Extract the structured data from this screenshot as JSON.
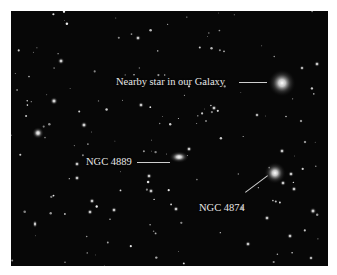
{
  "image": {
    "description": "Coma galaxy cluster astronomical photograph",
    "background_color": "#070707"
  },
  "labels": [
    {
      "id": "nearby-star",
      "text": "Nearby star in our Galaxy"
    },
    {
      "id": "ngc-4889",
      "text": "NGC 4889"
    },
    {
      "id": "ngc-4874",
      "text": "NGC 4874"
    }
  ]
}
